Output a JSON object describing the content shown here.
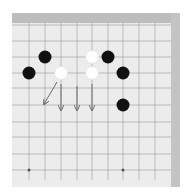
{
  "diagram": {
    "type": "go-board-partial",
    "grid": {
      "x_lines": [
        29,
        45,
        61,
        77,
        92,
        108,
        123,
        139,
        155
      ],
      "y_lines": [
        25,
        41,
        57,
        73,
        88,
        105,
        122,
        137,
        154,
        170
      ],
      "line_color": "#9a9a9a"
    },
    "stones": [
      {
        "color": "black",
        "x": 45,
        "y": 57
      },
      {
        "color": "black",
        "x": 29,
        "y": 73
      },
      {
        "color": "white",
        "x": 61,
        "y": 73
      },
      {
        "color": "white",
        "x": 92,
        "y": 57
      },
      {
        "color": "black",
        "x": 108,
        "y": 57
      },
      {
        "color": "white",
        "x": 92,
        "y": 73
      },
      {
        "color": "black",
        "x": 123,
        "y": 73
      },
      {
        "color": "black",
        "x": 123,
        "y": 105
      }
    ],
    "arrows": [
      {
        "x1": 57,
        "y1": 82,
        "x2": 44,
        "y2": 104
      },
      {
        "x1": 61,
        "y1": 84,
        "x2": 61,
        "y2": 110
      },
      {
        "x1": 77,
        "y1": 86,
        "x2": 77,
        "y2": 110
      },
      {
        "x1": 92,
        "y1": 84,
        "x2": 92,
        "y2": 110
      }
    ],
    "star_points": [
      {
        "x": 29,
        "y": 170
      },
      {
        "x": 123,
        "y": 170
      }
    ],
    "colors": {
      "black_stone": "#111111",
      "white_stone": "#ffffff",
      "arrow": "#6a6a6a"
    }
  },
  "caption": ""
}
